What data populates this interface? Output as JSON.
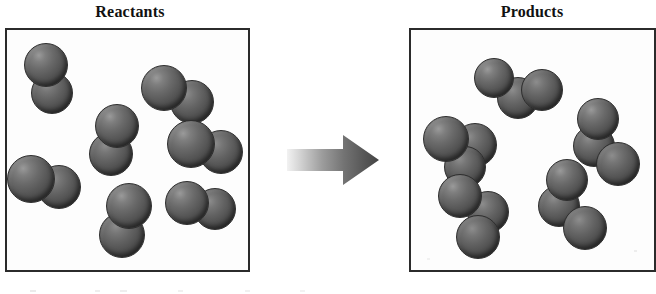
{
  "diagram": {
    "type": "chemical-reaction-particulate-diagram",
    "background_color": "#ffffff",
    "atom_color": "#5a5a5a",
    "box_border_color": "#2b2b2b",
    "arrow_gradient": [
      "#e8e8e8",
      "#4a4a4a"
    ]
  },
  "panels": {
    "reactants": {
      "title": "Reactants",
      "molecule_count": 7,
      "atoms_per_molecule": 2,
      "molecules": [
        {
          "x": 46,
          "y": 77,
          "atoms": [
            {
              "dx": -2,
              "dy": -14,
              "r": 22,
              "depth": "front"
            },
            {
              "dx": 4,
              "dy": 14,
              "r": 21,
              "depth": "back"
            }
          ]
        },
        {
          "x": 174,
          "y": 92,
          "atoms": [
            {
              "dx": -12,
              "dy": -6,
              "r": 23,
              "depth": "front"
            },
            {
              "dx": 16,
              "dy": 8,
              "r": 22,
              "depth": "back"
            }
          ]
        },
        {
          "x": 113,
          "y": 138,
          "atoms": [
            {
              "dx": 2,
              "dy": -14,
              "r": 22,
              "depth": "front"
            },
            {
              "dx": -4,
              "dy": 14,
              "r": 22,
              "depth": "back"
            }
          ]
        },
        {
          "x": 203,
          "y": 144,
          "atoms": [
            {
              "dx": -14,
              "dy": -2,
              "r": 24,
              "depth": "front"
            },
            {
              "dx": 16,
              "dy": 6,
              "r": 22,
              "depth": "back"
            }
          ]
        },
        {
          "x": 42,
          "y": 180,
          "atoms": [
            {
              "dx": -13,
              "dy": -3,
              "r": 24,
              "depth": "front"
            },
            {
              "dx": 15,
              "dy": 5,
              "r": 22,
              "depth": "back"
            }
          ]
        },
        {
          "x": 124,
          "y": 218,
          "atoms": [
            {
              "dx": 3,
              "dy": -14,
              "r": 23,
              "depth": "front"
            },
            {
              "dx": -4,
              "dy": 15,
              "r": 23,
              "depth": "back"
            }
          ]
        },
        {
          "x": 198,
          "y": 203,
          "atoms": [
            {
              "dx": -13,
              "dy": -2,
              "r": 22,
              "depth": "front"
            },
            {
              "dx": 15,
              "dy": 4,
              "r": 21,
              "depth": "back"
            }
          ]
        }
      ]
    },
    "products": {
      "title": "Products",
      "molecule_count": 5,
      "atoms_per_molecule": 3,
      "molecules": [
        {
          "x": 516,
          "y": 90,
          "atoms": [
            {
              "dx": -24,
              "dy": -14,
              "r": 20,
              "depth": "front"
            },
            {
              "dx": 0,
              "dy": 6,
              "r": 21,
              "depth": "back"
            },
            {
              "dx": 24,
              "dy": -2,
              "r": 21,
              "depth": "back"
            }
          ]
        },
        {
          "x": 461,
          "y": 143,
          "atoms": [
            {
              "dx": -17,
              "dy": -6,
              "r": 23,
              "depth": "front"
            },
            {
              "dx": 12,
              "dy": 0,
              "r": 22,
              "depth": "back"
            },
            {
              "dx": 2,
              "dy": 22,
              "r": 21,
              "depth": "back"
            }
          ]
        },
        {
          "x": 596,
          "y": 138,
          "atoms": [
            {
              "dx": 0,
              "dy": -21,
              "r": 21,
              "depth": "front"
            },
            {
              "dx": -4,
              "dy": 6,
              "r": 21,
              "depth": "back"
            },
            {
              "dx": 20,
              "dy": 24,
              "r": 22,
              "depth": "back"
            }
          ]
        },
        {
          "x": 473,
          "y": 208,
          "atoms": [
            {
              "dx": -15,
              "dy": -14,
              "r": 22,
              "depth": "front"
            },
            {
              "dx": 13,
              "dy": 2,
              "r": 21,
              "depth": "back"
            },
            {
              "dx": 3,
              "dy": 27,
              "r": 22,
              "depth": "back"
            }
          ]
        },
        {
          "x": 563,
          "y": 200,
          "atoms": [
            {
              "dx": 2,
              "dy": -22,
              "r": 21,
              "depth": "front"
            },
            {
              "dx": -6,
              "dy": 4,
              "r": 21,
              "depth": "back"
            },
            {
              "dx": 20,
              "dy": 26,
              "r": 22,
              "depth": "back"
            }
          ]
        }
      ]
    }
  },
  "arrow": {
    "label": "reaction-arrow",
    "direction": "right",
    "gradient_start": "#ededed",
    "gradient_end": "#4a4a4a"
  }
}
